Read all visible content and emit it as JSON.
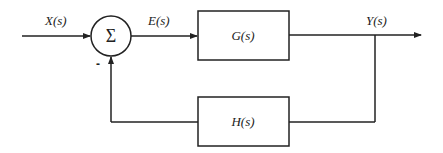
{
  "diagram": {
    "type": "feedback-control-block-diagram",
    "signals": {
      "input": "X(s)",
      "error": "E(s)",
      "output": "Y(s)"
    },
    "summing_junction": {
      "symbol": "Σ",
      "feedback_sign": "-"
    },
    "blocks": {
      "forward": "G(s)",
      "feedback": "H(s)"
    },
    "colors": {
      "stroke": "#222222",
      "background": "#ffffff"
    }
  }
}
